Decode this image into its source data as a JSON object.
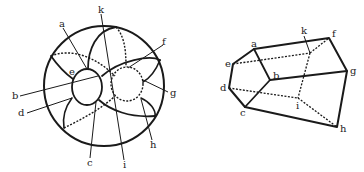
{
  "figure": {
    "left_panel": {
      "name": "sphere-projection",
      "labels": {
        "a": "a",
        "b": "b",
        "c": "c",
        "d": "d",
        "e": "e",
        "f": "f",
        "g": "g",
        "h": "h",
        "i": "i",
        "k": "k"
      }
    },
    "right_panel": {
      "name": "polyhedron-wireframe",
      "labels": {
        "a": "a",
        "b": "b",
        "c": "c",
        "d": "d",
        "e": "e",
        "f": "f",
        "g": "g",
        "h": "h",
        "i": "i",
        "k": "k"
      },
      "vertices": {
        "a": [
          254,
          49
        ],
        "b": [
          270,
          80
        ],
        "c": [
          245,
          107
        ],
        "d": [
          229,
          88
        ],
        "e": [
          233,
          64
        ],
        "f": [
          329,
          38
        ],
        "g": [
          347,
          71
        ],
        "h": [
          337,
          127
        ],
        "i": [
          298,
          98
        ],
        "k": [
          310,
          53
        ]
      }
    }
  }
}
